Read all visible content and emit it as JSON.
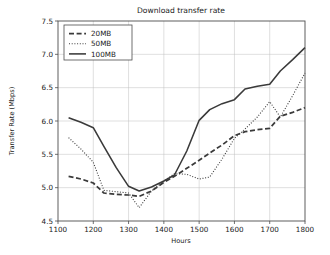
{
  "chart_data": {
    "type": "line",
    "title": "Download transfer rate",
    "xlabel": "Hours",
    "ylabel": "Transfer Rate (Mbps)",
    "xlim": [
      1100,
      1800
    ],
    "ylim": [
      4.5,
      7.5
    ],
    "xticks": [
      1100,
      1200,
      1300,
      1400,
      1500,
      1600,
      1700,
      1800
    ],
    "xtick_labels": [
      "1100",
      "1200",
      "1300",
      "1400",
      "1500",
      "1600",
      "1700",
      "1800"
    ],
    "yticks": [
      4.5,
      5.0,
      5.5,
      6.0,
      6.5,
      7.0,
      7.5
    ],
    "ytick_labels": [
      "4.5",
      "5.0",
      "5.5",
      "6.0",
      "6.5",
      "7.0",
      "7.5"
    ],
    "grid": true,
    "legend_position": "upper left",
    "x": [
      1130,
      1165,
      1200,
      1230,
      1265,
      1300,
      1330,
      1365,
      1400,
      1430,
      1465,
      1500,
      1530,
      1565,
      1600,
      1630,
      1665,
      1700,
      1730,
      1765,
      1800
    ],
    "series": [
      {
        "name": "20MB",
        "style": "dashed",
        "color": "#3a3a3a",
        "values": [
          5.17,
          5.13,
          5.07,
          4.92,
          4.9,
          4.89,
          4.87,
          4.95,
          5.08,
          5.17,
          5.29,
          5.41,
          5.52,
          5.64,
          5.78,
          5.84,
          5.87,
          5.89,
          6.07,
          6.13,
          6.2
        ]
      },
      {
        "name": "50MB",
        "style": "dotted",
        "color": "#3a3a3a",
        "values": [
          5.75,
          5.58,
          5.38,
          4.96,
          4.94,
          4.92,
          4.7,
          4.95,
          5.1,
          5.21,
          5.2,
          5.13,
          5.16,
          5.43,
          5.74,
          5.88,
          6.06,
          6.29,
          6.06,
          6.38,
          6.72
        ]
      },
      {
        "name": "100MB",
        "style": "solid",
        "color": "#3a3a3a",
        "values": [
          6.05,
          5.98,
          5.9,
          5.62,
          5.3,
          5.02,
          4.95,
          5.01,
          5.1,
          5.19,
          5.55,
          6.01,
          6.17,
          6.26,
          6.32,
          6.48,
          6.52,
          6.55,
          6.75,
          6.92,
          7.1
        ]
      }
    ],
    "legend_entries": [
      "20MB",
      "50MB",
      "100MB"
    ]
  }
}
